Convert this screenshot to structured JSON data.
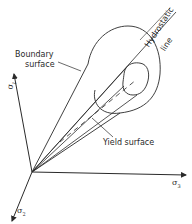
{
  "diagram": {
    "labels": {
      "boundary_surface_line1": "Boundary",
      "boundary_surface_line2": "surface",
      "yield_surface": "Yield surface",
      "hydrostatic_line1": "Hydrostatic",
      "hydrostatic_line2": "line"
    },
    "axes": {
      "sigma1": {
        "symbol": "σ",
        "subscript": "1"
      },
      "sigma2": {
        "symbol": "σ",
        "subscript": "2"
      },
      "sigma3": {
        "symbol": "σ",
        "subscript": "3"
      }
    },
    "colors": {
      "line": "#2a2a2a",
      "background": "#ffffff"
    }
  }
}
